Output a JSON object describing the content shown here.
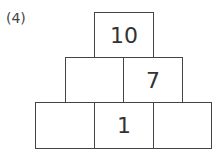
{
  "problem_label": "(4)",
  "pyramid": {
    "top": [
      "10"
    ],
    "middle": [
      "",
      "7"
    ],
    "bottom": [
      "",
      "1",
      ""
    ]
  }
}
